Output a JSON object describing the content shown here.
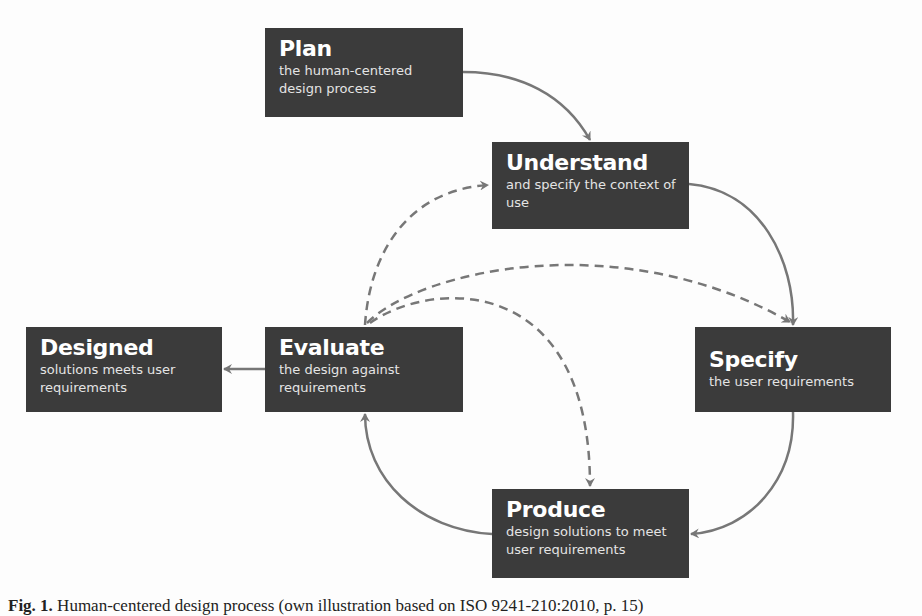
{
  "diagram": {
    "nodes": {
      "plan": {
        "title": "Plan",
        "subtitle": "the human-centered design process"
      },
      "understand": {
        "title": "Understand",
        "subtitle": "and specify the context of use"
      },
      "specify": {
        "title": "Specify",
        "subtitle": "the user requirements"
      },
      "produce": {
        "title": "Produce",
        "subtitle": "design solutions to meet user requirements"
      },
      "evaluate": {
        "title": "Evaluate",
        "subtitle": "the design against requirements"
      },
      "designed": {
        "title": "Designed",
        "subtitle": "solutions meets user requirements"
      }
    },
    "edges": [
      {
        "from": "plan",
        "to": "understand",
        "style": "solid"
      },
      {
        "from": "understand",
        "to": "specify",
        "style": "solid"
      },
      {
        "from": "specify",
        "to": "produce",
        "style": "solid"
      },
      {
        "from": "produce",
        "to": "evaluate",
        "style": "solid"
      },
      {
        "from": "evaluate",
        "to": "designed",
        "style": "solid"
      },
      {
        "from": "evaluate",
        "to": "understand",
        "style": "dashed"
      },
      {
        "from": "evaluate",
        "to": "specify",
        "style": "dashed"
      },
      {
        "from": "evaluate",
        "to": "produce",
        "style": "dashed"
      }
    ],
    "colors": {
      "box": "#3b3b3b",
      "text": "#ffffff",
      "arrow": "#777777"
    }
  },
  "caption": {
    "label": "Fig. 1.",
    "text": " Human-centered design process (own illustration based on ISO 9241-210:2010, p. 15)"
  }
}
